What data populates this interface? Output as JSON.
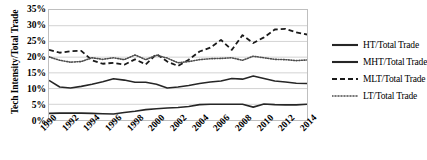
{
  "chart_data": {
    "type": "line",
    "title": "",
    "xlabel": "",
    "ylabel": "Tech Intensity/Total Trade",
    "ylim": [
      0,
      35
    ],
    "yticks": [
      "0%",
      "5%",
      "10%",
      "15%",
      "20%",
      "25%",
      "30%",
      "35%"
    ],
    "ytick_values": [
      0,
      5,
      10,
      15,
      20,
      25,
      30,
      35
    ],
    "grid": true,
    "legend_position": "right",
    "x": [
      1990,
      1991,
      1992,
      1993,
      1994,
      1995,
      1996,
      1997,
      1998,
      1999,
      2000,
      2001,
      2002,
      2003,
      2004,
      2005,
      2006,
      2007,
      2008,
      2009,
      2010,
      2011,
      2012,
      2013,
      2014
    ],
    "xtick_labels": [
      "1990",
      "1992",
      "1994",
      "1996",
      "1998",
      "2000",
      "2002",
      "2004",
      "2006",
      "2008",
      "2010",
      "2012",
      "2014"
    ],
    "xtick_values": [
      1990,
      1992,
      1994,
      1996,
      1998,
      2000,
      2002,
      2004,
      2006,
      2008,
      2010,
      2012,
      2014
    ],
    "series": [
      {
        "name": "HT/Total Trade",
        "style": "solid",
        "color": "#262626",
        "values": [
          2.1,
          2.2,
          2.2,
          2.2,
          2.1,
          2.0,
          1.9,
          2.4,
          2.8,
          3.3,
          3.6,
          3.8,
          4.0,
          4.3,
          4.9,
          5.0,
          5.0,
          5.0,
          5.0,
          4.1,
          5.1,
          4.9,
          4.8,
          4.8,
          5.0
        ]
      },
      {
        "name": "MHT/Total Trade",
        "style": "solid",
        "color": "#262626",
        "values": [
          12.6,
          10.5,
          10.2,
          10.7,
          11.4,
          12.2,
          13.1,
          12.7,
          12.0,
          12.0,
          11.4,
          10.2,
          10.5,
          11.0,
          11.6,
          12.1,
          12.4,
          13.2,
          13.0,
          14.0,
          13.2,
          12.4,
          12.1,
          11.7,
          11.6
        ]
      },
      {
        "name": "MLT/Total Trade",
        "style": "dashed",
        "color": "#1a1a1a",
        "values": [
          22.3,
          21.4,
          21.9,
          22.0,
          19.0,
          17.9,
          18.2,
          17.6,
          19.3,
          17.7,
          21.0,
          18.6,
          17.2,
          19.2,
          21.8,
          23.0,
          25.5,
          22.3,
          27.0,
          24.5,
          26.3,
          28.8,
          29.0,
          27.9,
          27.2
        ]
      },
      {
        "name": "LT/Total Trade",
        "style": "dotted",
        "color": "#4d4d4d",
        "values": [
          20.1,
          19.0,
          18.4,
          18.6,
          19.8,
          19.3,
          19.8,
          19.2,
          20.7,
          19.2,
          20.6,
          19.7,
          18.2,
          18.6,
          19.2,
          19.5,
          19.6,
          19.8,
          19.0,
          20.3,
          19.8,
          19.3,
          19.2,
          18.9,
          19.1
        ]
      }
    ]
  },
  "legend": {
    "items": [
      {
        "label": "HT/Total Trade"
      },
      {
        "label": "MHT/Total Trade"
      },
      {
        "label": "MLT/Total Trade"
      },
      {
        "label": "LT/Total Trade"
      }
    ]
  },
  "colors": {
    "grid": "#bfbfbf",
    "plot_border": "#bfbfbf",
    "text": "#000000"
  }
}
